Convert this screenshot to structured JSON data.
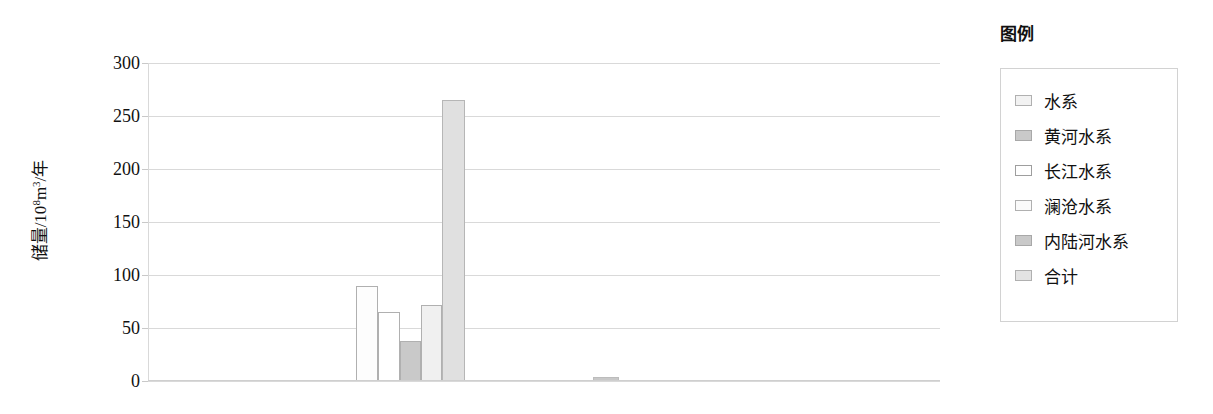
{
  "legend": {
    "title": "图例",
    "items": [
      {
        "label": "水系",
        "color": "#f2f2f2",
        "border": "#b0b0b0"
      },
      {
        "label": "黄河水系",
        "color": "#c9c9c9",
        "border": "#a8a8a8"
      },
      {
        "label": "长江水系",
        "color": "#ffffff",
        "border": "#9e9e9e"
      },
      {
        "label": "澜沧水系",
        "color": "#fafafa",
        "border": "#b0b0b0"
      },
      {
        "label": "内陆河水系",
        "color": "#c9c9c9",
        "border": "#a8a8a8"
      },
      {
        "label": "合计",
        "color": "#e3e3e3",
        "border": "#b0b0b0"
      }
    ]
  },
  "axis": {
    "ylabel_text": "储量/10",
    "ylabel_exp": "8",
    "ylabel_text2": "m",
    "ylabel_exp2": "3",
    "ylabel_text3": "/年",
    "yticks": [
      "300",
      "250",
      "200",
      "150",
      "100",
      "50",
      "0"
    ]
  },
  "chart_data": {
    "type": "bar",
    "title": "",
    "xlabel": "",
    "ylabel": "储量/10^8 m^3/年",
    "ylim": [
      0,
      300
    ],
    "ytick_values": [
      0,
      50,
      100,
      150,
      200,
      250,
      300
    ],
    "grid": true,
    "legend_position": "right-outside",
    "categories": [
      "水系",
      "黄河水系",
      "长江水系",
      "澜沧水系",
      "内陆河水系",
      "合计"
    ],
    "series": [
      {
        "name": "储量",
        "values": [
          90,
          65,
          38,
          72,
          265,
          1
        ],
        "bars": [
          {
            "category": "水系",
            "value": 90,
            "x_px": 356,
            "width_px": 22,
            "fill": "#fdfdfd",
            "border": "#b0b0b0"
          },
          {
            "category": "黄河水系",
            "value": 65,
            "x_px": 378,
            "width_px": 22,
            "fill": "#ffffff",
            "border": "#b0b0b0"
          },
          {
            "category": "长江水系",
            "value": 38,
            "x_px": 400,
            "width_px": 21,
            "fill": "#c9c9c9",
            "border": "#b0b0b0"
          },
          {
            "category": "澜沧水系",
            "value": 72,
            "x_px": 421,
            "width_px": 21,
            "fill": "#f0f0f0",
            "border": "#b0b0b0"
          },
          {
            "category": "内陆河水系",
            "value": 265,
            "x_px": 442,
            "width_px": 23,
            "fill": "#e0e0e0",
            "border": "#b6b6b6"
          },
          {
            "category": "合计",
            "value": 1,
            "x_px": 593,
            "width_px": 26,
            "fill": "#c8c8c8",
            "border": "#bcbcbc"
          }
        ]
      }
    ]
  }
}
